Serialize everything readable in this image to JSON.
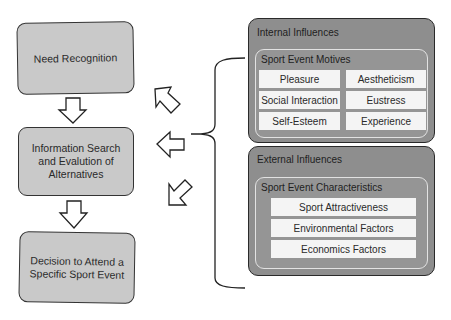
{
  "diagram": {
    "process_steps": [
      {
        "label": "Need Recognition"
      },
      {
        "label": "Information Search and Evalution of Alternatives"
      },
      {
        "label": "Decision to Attend a Specific Sport Event"
      }
    ],
    "internal": {
      "title": "Internal Influences",
      "group_title": "Sport Event Motives",
      "items": [
        "Pleasure",
        "Aestheticism",
        "Social Interaction",
        "Eustress",
        "Self-Esteem",
        "Experience"
      ]
    },
    "external": {
      "title": "External Influences",
      "group_title": "Sport Event Characteristics",
      "items": [
        "Sport Attractiveness",
        "Environmental Factors",
        "Economics Factors"
      ]
    },
    "arrows": {
      "down": [
        "Need Recognition -> Information Search",
        "Information Search -> Decision"
      ],
      "influence": [
        "up-left toward Need Recognition",
        "left toward Information Search",
        "down-left toward Decision"
      ]
    },
    "colors": {
      "step_fill": "#c9c9c9",
      "panel_fill": "#8e8e8e",
      "cell_fill": "#f4f4f4",
      "stroke": "#333333"
    }
  }
}
